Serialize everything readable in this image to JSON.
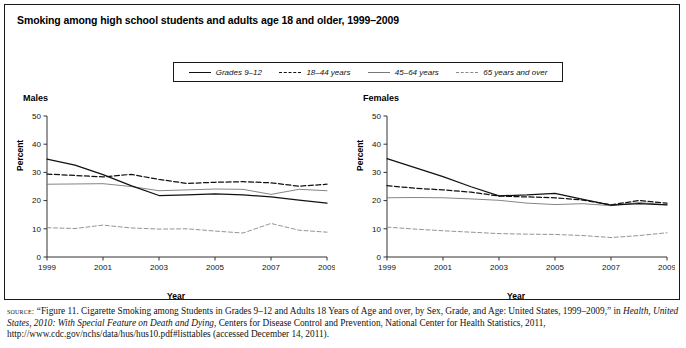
{
  "figure": {
    "title": "Smoking among high school students and adults age 18 and older, 1999–2009",
    "source_label": "source:",
    "source_text_1": " “Figure 11. Cigarette Smoking among Students in Grades 9–12 and Adults 18 Years of Age and over, by Sex, Grade, and Age: United States, 1999–2009,” in ",
    "source_text_italic": "Health, United States, 2010: With Special Feature on Death and Dying",
    "source_text_2": ", Centers for Disease Control and Prevention, National Center for Health Statistics, 2011, http://www.cdc.gov/nchs/data/hus/hus10.pdf#listtables (accessed December 14, 2011)."
  },
  "legend": {
    "items": [
      {
        "label": "Grades 9–12",
        "style": "solid",
        "color": "#111111"
      },
      {
        "label": "18–44 years",
        "style": "dashed",
        "color": "#111111"
      },
      {
        "label": "45–64 years",
        "style": "solid-light",
        "color": "#777777"
      },
      {
        "label": "65 years and over",
        "style": "dashed-light",
        "color": "#888888"
      }
    ]
  },
  "panels": [
    {
      "name": "males",
      "title": "Males"
    },
    {
      "name": "females",
      "title": "Females"
    }
  ],
  "axes": {
    "ylabel": "Percent",
    "xlabel": "Year",
    "yticks": [
      0,
      10,
      20,
      30,
      40,
      50
    ],
    "xticks": [
      1999,
      2001,
      2003,
      2005,
      2007,
      2009
    ]
  },
  "chart_data": [
    {
      "type": "line",
      "title": "Males",
      "xlabel": "Year",
      "ylabel": "Percent",
      "xlim": [
        1999,
        2009
      ],
      "ylim": [
        0,
        50
      ],
      "grid": false,
      "legend_position": "top-center-shared",
      "x": [
        1999,
        2000,
        2001,
        2002,
        2003,
        2004,
        2005,
        2006,
        2007,
        2008,
        2009
      ],
      "series": [
        {
          "name": "Grades 9–12",
          "style": "solid",
          "color": "#111111",
          "values": [
            34.7,
            32.6,
            29.2,
            25.3,
            21.8,
            22.0,
            22.4,
            22.0,
            21.3,
            20.2,
            19.1
          ]
        },
        {
          "name": "18–44 years",
          "style": "dashed",
          "color": "#111111",
          "values": [
            29.4,
            28.9,
            28.4,
            29.3,
            27.5,
            26.1,
            26.5,
            26.7,
            26.3,
            25.1,
            25.8
          ]
        },
        {
          "name": "45–64 years",
          "style": "solid-light",
          "color": "#777777",
          "values": [
            25.8,
            25.9,
            26.0,
            25.0,
            23.5,
            23.8,
            24.1,
            24.0,
            22.2,
            24.0,
            23.5
          ]
        },
        {
          "name": "65 years and over",
          "style": "dashed-light",
          "color": "#888888",
          "values": [
            10.4,
            10.1,
            11.3,
            10.3,
            9.9,
            10.0,
            9.2,
            8.5,
            11.9,
            9.5,
            8.8
          ]
        }
      ]
    },
    {
      "type": "line",
      "title": "Females",
      "xlabel": "Year",
      "ylabel": "Percent",
      "xlim": [
        1999,
        2009
      ],
      "ylim": [
        0,
        50
      ],
      "grid": false,
      "legend_position": "top-center-shared",
      "x": [
        1999,
        2000,
        2001,
        2002,
        2003,
        2004,
        2005,
        2006,
        2007,
        2008,
        2009
      ],
      "series": [
        {
          "name": "Grades 9–12",
          "style": "solid",
          "color": "#111111",
          "values": [
            34.9,
            31.7,
            28.5,
            24.9,
            21.7,
            22.0,
            22.6,
            20.4,
            18.4,
            18.9,
            18.5
          ]
        },
        {
          "name": "18–44 years",
          "style": "dashed",
          "color": "#111111",
          "values": [
            25.3,
            24.4,
            23.8,
            23.0,
            21.6,
            21.3,
            21.0,
            20.2,
            18.5,
            20.0,
            19.1
          ]
        },
        {
          "name": "45–64 years",
          "style": "solid-light",
          "color": "#777777",
          "values": [
            21.0,
            21.1,
            21.0,
            20.6,
            20.1,
            19.1,
            18.6,
            18.9,
            18.2,
            19.3,
            18.5
          ]
        },
        {
          "name": "65 years and over",
          "style": "dashed-light",
          "color": "#888888",
          "values": [
            10.6,
            9.9,
            9.3,
            8.8,
            8.3,
            8.1,
            8.0,
            7.6,
            6.9,
            7.6,
            8.6
          ]
        }
      ]
    }
  ]
}
